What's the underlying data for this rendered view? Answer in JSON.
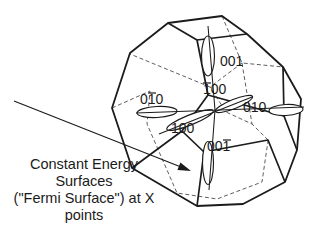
{
  "figure": {
    "background_color": "#ffffff",
    "line_color": "#1b1b1b",
    "hidden_line_color": "#5f5f5f",
    "miller_labels": {
      "top": {
        "text": "001",
        "overbar_digit": null
      },
      "back": {
        "text": "100",
        "overbar_digit": 1
      },
      "left": {
        "text": "010",
        "overbar_digit": 2
      },
      "right": {
        "text": "010",
        "overbar_digit": null
      },
      "front": {
        "text": "100",
        "overbar_digit": null
      },
      "bottom": {
        "text": "001",
        "overbar_digit": 3
      }
    },
    "annotation": {
      "line1": "Constant Energy",
      "line2": "Surfaces",
      "line3": "(\"Fermi Surface\") at X",
      "line4": "points"
    }
  }
}
